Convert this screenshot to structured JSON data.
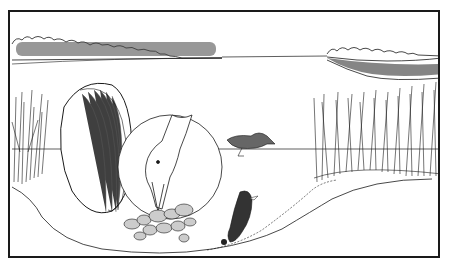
{
  "illustration": {
    "description": "Line drawing of a lake scene: distant treelines, reeds on both shores, a large clam shell, a magnified circle showing a duck's head feeding on clams on the lake bottom, a duck swimming on the surface, and a diving duck near the bottom.",
    "colors": {
      "ink": "#1a1a1a",
      "paper": "#ffffff",
      "shade": "#555555"
    }
  }
}
